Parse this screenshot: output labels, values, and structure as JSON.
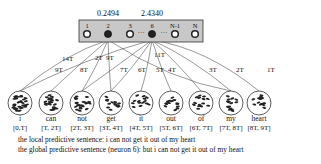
{
  "neuron_layer": {
    "neurons": [
      {
        "label": "1",
        "active": false
      },
      {
        "label": "2",
        "active": true,
        "value": "0.2494"
      },
      {
        "label": "3",
        "active": false
      },
      {
        "label": "6",
        "active": true,
        "value": "2.4340"
      },
      {
        "label": "N-1",
        "active": false
      },
      {
        "label": "N",
        "active": false
      }
    ],
    "ellipsis": "···"
  },
  "connection_labels": {
    "n2": [
      "14T",
      "9T",
      "8T",
      "2T",
      "9T"
    ],
    "n6": [
      "11T",
      "7T",
      "6T",
      "5T",
      "4T",
      "3T",
      "2T",
      "1T"
    ]
  },
  "words": [
    {
      "word": "i",
      "range": "[0,T]"
    },
    {
      "word": "can",
      "range": "[T, 2T]"
    },
    {
      "word": "not",
      "range": "[2T, 3T]"
    },
    {
      "word": "get",
      "range": "[3T, 4T]"
    },
    {
      "word": "it",
      "range": "[4T, 5T]"
    },
    {
      "word": "out",
      "range": "[5T, 6T]"
    },
    {
      "word": "of",
      "range": "[6T, 7T]"
    },
    {
      "word": "my",
      "range": "[7T, 8T]"
    },
    {
      "word": "heart",
      "range": "[8T, 9T]"
    }
  ],
  "sentences": {
    "local": "the local predictive sentence: i can not get it out of my heart",
    "global": "the global predictive sentence (neuron 6): but i can not get it out of my heart"
  }
}
